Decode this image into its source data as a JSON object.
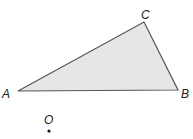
{
  "diagram": {
    "type": "geometry",
    "triangle": {
      "vertices": {
        "A": {
          "label": "A",
          "x": 18,
          "y": 91
        },
        "B": {
          "label": "B",
          "x": 178,
          "y": 90
        },
        "C": {
          "label": "C",
          "x": 144,
          "y": 22
        }
      },
      "fill": "#e6e6e6",
      "stroke": "#555555"
    },
    "point": {
      "label": "O",
      "x": 49,
      "y": 131,
      "color": "#111111"
    }
  }
}
